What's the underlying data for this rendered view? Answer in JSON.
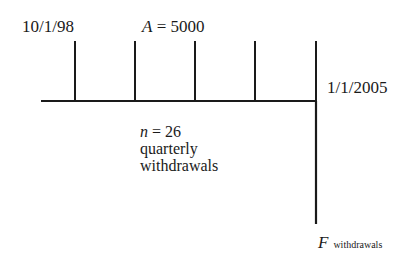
{
  "diagram": {
    "type": "cash-flow-timeline",
    "start_date": "10/1/98",
    "end_date": "1/1/2005",
    "annuity": {
      "symbol": "A",
      "equals": "=",
      "value": "5000"
    },
    "periods": {
      "symbol": "n",
      "equals": "=",
      "value": "26",
      "line1": "quarterly",
      "line2": "withdrawals"
    },
    "future_value": {
      "symbol": "F",
      "subscript": "withdrawals"
    },
    "line_color": "#1a1a1a"
  }
}
